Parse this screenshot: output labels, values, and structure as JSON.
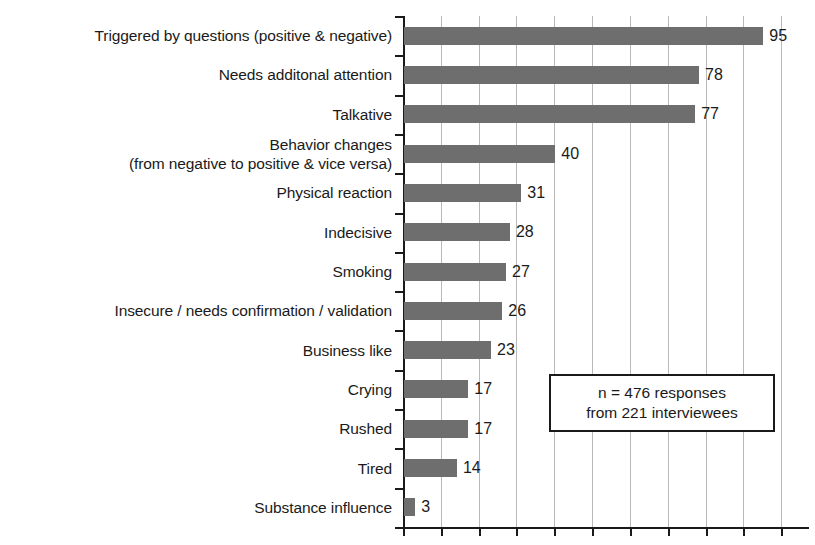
{
  "chart_data": {
    "type": "bar",
    "orientation": "horizontal",
    "title": "",
    "xlabel": "",
    "ylabel": "",
    "xlim": [
      0,
      101
    ],
    "grid": true,
    "grid_axis": "x",
    "grid_interval": 10,
    "legend": "none",
    "bar_color": "#6e6e6e",
    "axis_color": "#1a1a1a",
    "gridline_color": "#b9b9b9",
    "categories": [
      "Triggered by questions (positive & negative)",
      "Needs additonal attention",
      "Talkative",
      "Behavior changes\n(from negative to positive & vice versa)",
      "Physical reaction",
      "Indecisive",
      "Smoking",
      "Insecure / needs confirmation / validation",
      "Business like",
      "Crying",
      "Rushed",
      "Tired",
      "Substance influence"
    ],
    "values": [
      95,
      78,
      77,
      40,
      31,
      28,
      27,
      26,
      23,
      17,
      17,
      14,
      3
    ],
    "value_labels": [
      "95",
      "78",
      "77",
      "40",
      "31",
      "28",
      "27",
      "26",
      "23",
      "17",
      "17",
      "14",
      "3"
    ],
    "xticks_visible_labels": [],
    "xtick_count": 11,
    "annotation": {
      "line1": "n = 476 responses",
      "line2": "from 221 interviewees"
    }
  }
}
